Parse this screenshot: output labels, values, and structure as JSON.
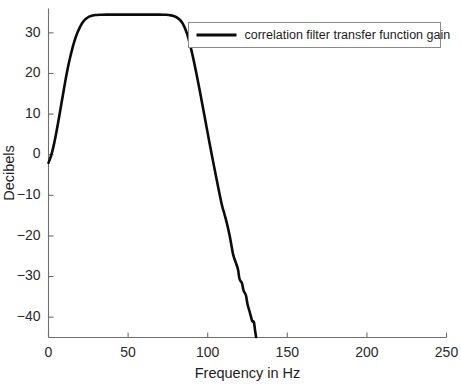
{
  "figure": {
    "background_color": "#ffffff",
    "curve_color": "#0b0b0b",
    "axis_color": "#6e6e6e",
    "text_color": "#1c1c1c"
  },
  "chart_data": {
    "type": "line",
    "title": "",
    "xlabel": "Frequency in Hz",
    "ylabel": "Decibels",
    "xlim": [
      0,
      250
    ],
    "ylim": [
      -45,
      36
    ],
    "xticks": [
      0,
      50,
      100,
      150,
      200,
      250
    ],
    "yticks": [
      30,
      20,
      10,
      0,
      -10,
      -20,
      -30,
      -40
    ],
    "xtick_labels": [
      "0",
      "50",
      "100",
      "150",
      "200",
      "250"
    ],
    "ytick_labels": [
      "30",
      "20",
      "10",
      "0",
      "−10",
      "−20",
      "−30",
      "−40"
    ],
    "grid": false,
    "legend_position": "top-right",
    "series": [
      {
        "name": "correlation filter transfer function gain",
        "color": "#0b0b0b",
        "x": [
          0,
          1.5,
          3,
          4.5,
          6,
          7.5,
          9,
          10.5,
          12,
          13.5,
          15,
          16.5,
          18,
          19.5,
          21,
          22.5,
          24,
          25.5,
          27,
          28.5,
          30,
          33,
          36,
          40,
          45,
          50,
          55,
          60,
          65,
          70,
          74,
          77,
          79,
          81,
          83,
          85,
          87,
          89,
          91,
          93,
          95,
          97,
          99,
          101,
          103,
          105,
          107,
          109,
          110.5,
          112,
          113.5,
          114.5,
          116,
          117.5,
          119,
          120,
          121.5,
          122.5,
          124,
          125,
          126,
          127,
          128,
          129,
          129.8,
          130.4
        ],
        "y": [
          -2.0,
          -0.4,
          1.8,
          4.6,
          7.8,
          11.2,
          14.6,
          18.0,
          21.1,
          23.8,
          26.2,
          28.2,
          29.9,
          31.2,
          32.3,
          33.1,
          33.6,
          34.0,
          34.2,
          34.35,
          34.4,
          34.45,
          34.5,
          34.5,
          34.5,
          34.5,
          34.5,
          34.5,
          34.5,
          34.48,
          34.45,
          34.3,
          34.1,
          33.7,
          33.0,
          31.8,
          29.8,
          27.0,
          23.6,
          19.8,
          15.8,
          11.6,
          7.4,
          3.2,
          -0.9,
          -4.9,
          -8.8,
          -12.5,
          -14.6,
          -16.8,
          -19.4,
          -21.4,
          -24.6,
          -26.4,
          -28.2,
          -30.6,
          -31.6,
          -33.4,
          -34.6,
          -36.8,
          -38.2,
          -39.6,
          -41.0,
          -41.2,
          -43.4,
          -44.9
        ]
      }
    ]
  },
  "legend": {
    "entries": [
      {
        "label": "correlation filter transfer function gain"
      }
    ]
  }
}
